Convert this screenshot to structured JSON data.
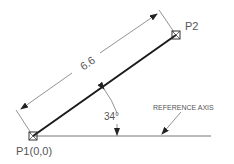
{
  "diagram": {
    "points": {
      "p1": {
        "label": "P1",
        "coords": "(0,0)"
      },
      "p2": {
        "label": "P2"
      }
    },
    "dimension": {
      "length": "6.6"
    },
    "angle": {
      "value": "34°"
    },
    "reference_axis": {
      "label": "REFERENCE AXIS"
    },
    "colors": {
      "line": "#1a1a1a",
      "thin": "#555555",
      "text": "#555555"
    }
  }
}
